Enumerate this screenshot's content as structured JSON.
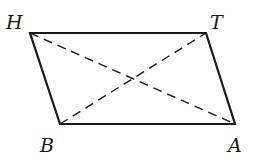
{
  "diagram": {
    "type": "parallelogram",
    "vertices": [
      {
        "name": "H",
        "x": 30,
        "y": 33,
        "label_x": 6,
        "label_y": 29
      },
      {
        "name": "T",
        "x": 206,
        "y": 33,
        "label_x": 210,
        "label_y": 29
      },
      {
        "name": "A",
        "x": 235,
        "y": 124,
        "label_x": 228,
        "label_y": 152
      },
      {
        "name": "B",
        "x": 60,
        "y": 124,
        "label_x": 40,
        "label_y": 152
      }
    ],
    "edges": [
      {
        "from": "H",
        "to": "T",
        "style": "solid"
      },
      {
        "from": "T",
        "to": "A",
        "style": "solid"
      },
      {
        "from": "A",
        "to": "B",
        "style": "solid"
      },
      {
        "from": "B",
        "to": "H",
        "style": "solid"
      }
    ],
    "diagonals": [
      {
        "from": "H",
        "to": "A",
        "style": "dashed"
      },
      {
        "from": "B",
        "to": "T",
        "style": "dashed"
      }
    ],
    "stroke_color": "#1a1a1a"
  }
}
